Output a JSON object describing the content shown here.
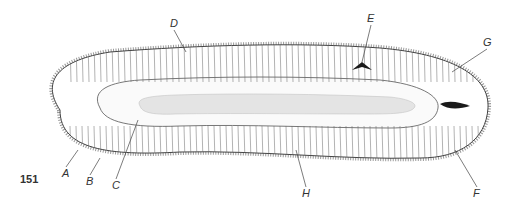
{
  "figure": {
    "number": "151",
    "labels": [
      {
        "id": "A",
        "text": "A",
        "x": 62,
        "y": 168,
        "tx": 78,
        "ty": 150
      },
      {
        "id": "B",
        "text": "B",
        "x": 86,
        "y": 176,
        "tx": 100,
        "ty": 158
      },
      {
        "id": "C",
        "text": "C",
        "x": 112,
        "y": 180,
        "tx": 138,
        "ty": 120
      },
      {
        "id": "D",
        "text": "D",
        "x": 170,
        "y": 18,
        "tx": 186,
        "ty": 52
      },
      {
        "id": "E",
        "text": "E",
        "x": 367,
        "y": 13,
        "tx": 362,
        "ty": 62
      },
      {
        "id": "F",
        "text": "F",
        "x": 473,
        "y": 188,
        "tx": 455,
        "ty": 150
      },
      {
        "id": "G",
        "text": "G",
        "x": 483,
        "y": 37,
        "tx": 452,
        "ty": 72
      },
      {
        "id": "H",
        "text": "H",
        "x": 302,
        "y": 188,
        "tx": 296,
        "ty": 150
      }
    ]
  },
  "colors": {
    "ink": "#333333",
    "lumen": "#e4e4e4",
    "dark_cell": "#1a1a1a",
    "background": "#ffffff"
  }
}
